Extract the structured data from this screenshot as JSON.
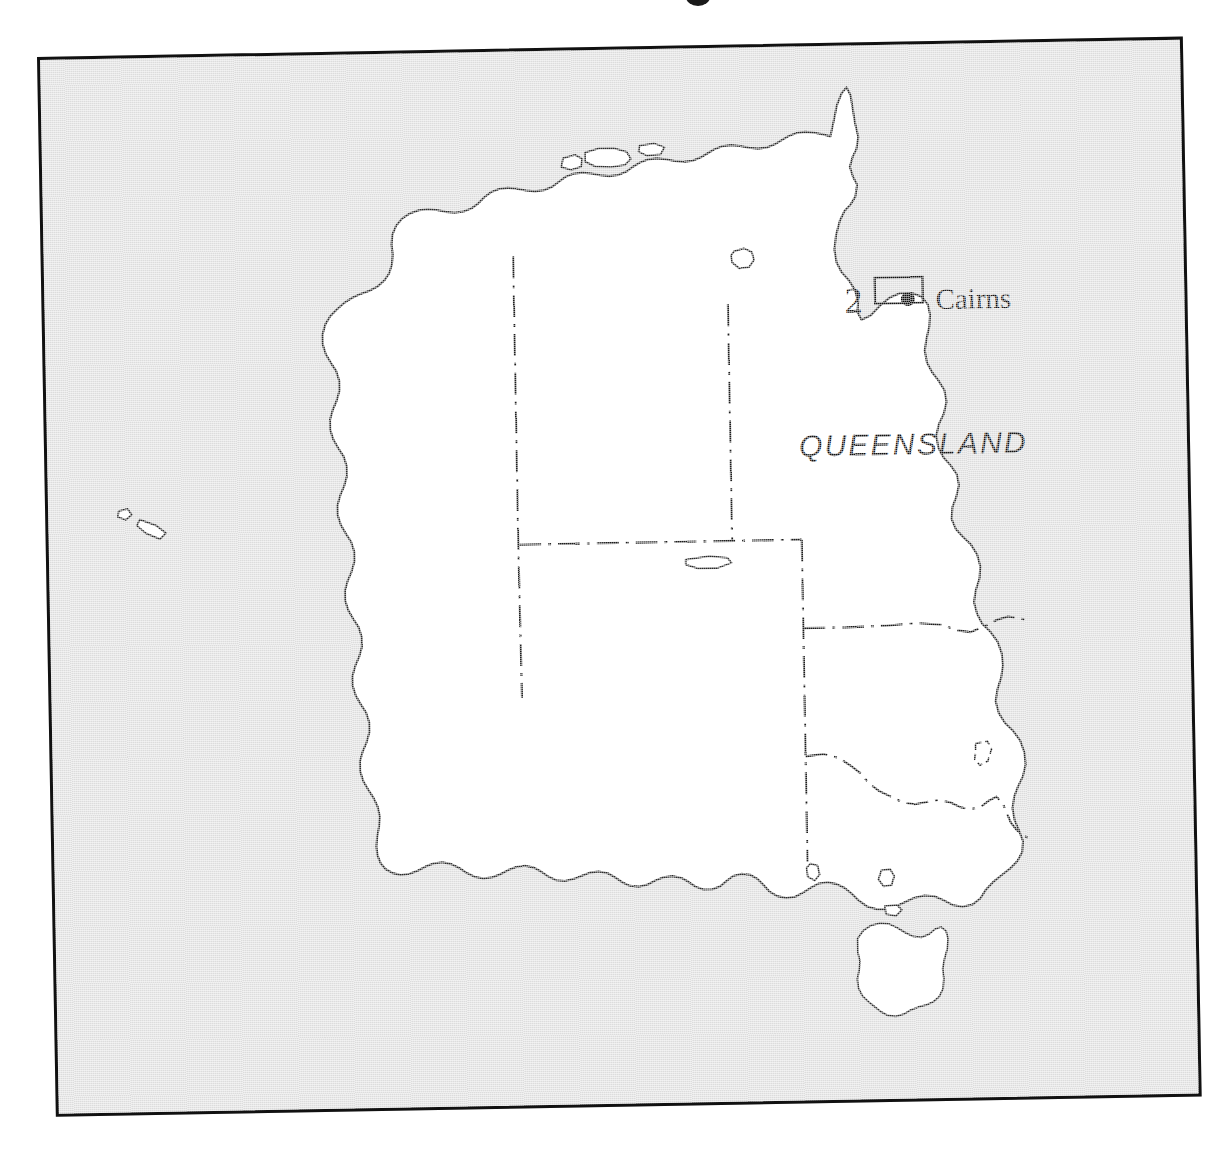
{
  "page": {
    "kind": "locality-map",
    "background_color": "#ffffff"
  },
  "frame": {
    "border_color": "#111111",
    "sea_fill": "#dcdcdc",
    "land_fill": "#ffffff",
    "coast_stroke": "#2b2b2b",
    "rotation_deg": -1.02
  },
  "map": {
    "labels": {
      "state": "QUEENSLAND",
      "city": "Cairns",
      "inset_number": "2"
    },
    "markers": [
      {
        "name": "Cairns",
        "type": "city-dot",
        "x": 905,
        "y": 313
      }
    ],
    "inset_rectangle": {
      "label": "2",
      "x": 872,
      "y": 291,
      "width": 48,
      "height": 26
    },
    "state_borders": [
      "WA-NT-SA western border",
      "NT-SA northern border",
      "NT-QLD border",
      "QLD-NSW border",
      "NSW-VIC border",
      "SA-NSW-VIC border",
      "ACT enclave"
    ],
    "islands": [
      "Melville Island",
      "Bathurst Island",
      "Groote Eylandt",
      "Dirk Hartog Island",
      "Kangaroo Island",
      "King Island",
      "Flinders Island",
      "Tasmania"
    ]
  }
}
